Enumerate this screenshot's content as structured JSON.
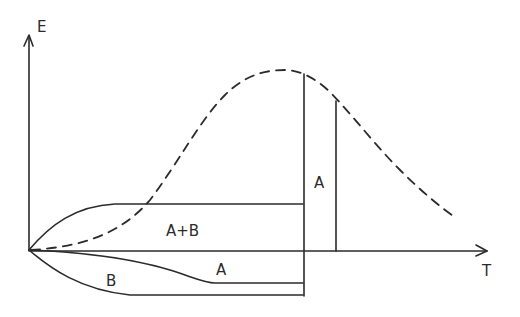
{
  "diagram": {
    "axes": {
      "y_label": "E",
      "x_label": "T"
    },
    "regions": {
      "upper_region_label": "A+B",
      "lower_right_label": "A",
      "lower_left_label": "B",
      "vertical_strip_label": "A"
    },
    "curves": [
      {
        "name": "bell-curve",
        "style": "dashed",
        "description": "Bell-shaped curve rising from origin, peak near the tall vertical line, decaying to the right"
      },
      {
        "name": "upper-boundary",
        "style": "solid",
        "description": "Rises from origin then levels off above the T axis, ending at the tall vertical line"
      },
      {
        "name": "lower-inner-boundary",
        "style": "solid",
        "description": "Descends from origin below the T axis, levels off, ending at the tall vertical line"
      },
      {
        "name": "lower-outer-boundary",
        "style": "solid",
        "description": "Descends more steeply from origin, levels off lowest, ending at the tall vertical line"
      }
    ],
    "vertical_lines": [
      {
        "name": "tall-vertical",
        "description": "From the bell curve down past the T axis to the lowest boundary"
      },
      {
        "name": "short-vertical",
        "description": "From the bell curve down to the T axis"
      }
    ]
  }
}
